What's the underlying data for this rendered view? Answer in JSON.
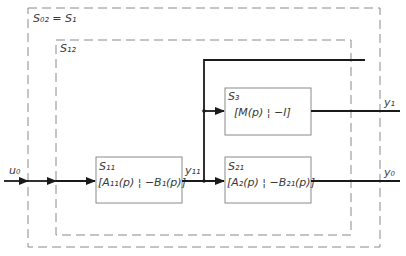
{
  "diagram": {
    "outer_system": {
      "label": "S₀₂ = S₁"
    },
    "inner_system": {
      "label": "S₁₂"
    },
    "blocks": [
      {
        "id": "S11",
        "name": "S₁₁",
        "formula": "[A₁₁(p) ¦ −B₁(p)]"
      },
      {
        "id": "S3",
        "name": "S₃",
        "formula": "[M(p) ¦ −I]"
      },
      {
        "id": "S21",
        "name": "S₂₁",
        "formula": "[A₂(p) ¦ −B₂₁(p)]"
      }
    ],
    "signals": {
      "input": "u₀",
      "intermediate": "y₁₁",
      "output_1": "y₁",
      "output_0": "y₀"
    }
  }
}
